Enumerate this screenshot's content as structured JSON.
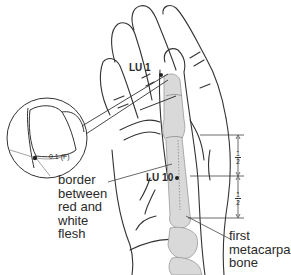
{
  "diagram": {
    "points": [
      {
        "id": "lu1",
        "label": "LU 1"
      },
      {
        "id": "lu10",
        "label": "LU 10"
      }
    ],
    "inset": {
      "measurement": "0.1 (F)"
    },
    "annotations": {
      "border": "border between red and white flesh",
      "bone": "first metacarpal bone"
    },
    "proportions": [
      {
        "numerator": "1",
        "denominator": "2"
      },
      {
        "numerator": "1",
        "denominator": "2"
      }
    ],
    "colors": {
      "outline": "#2a2a2a",
      "bone_fill": "#d9d9d9",
      "background": "#ffffff"
    }
  }
}
